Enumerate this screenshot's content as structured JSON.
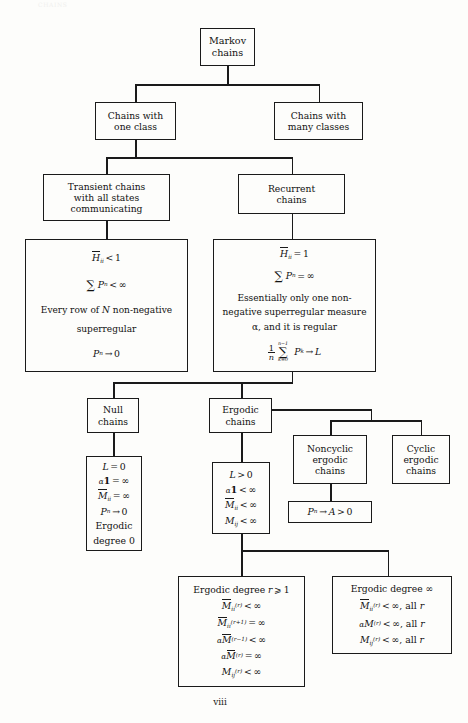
{
  "page": {
    "number": "viii",
    "header_faint": "CHAINS"
  },
  "diagram": {
    "nodes": {
      "root": {
        "lines": [
          "Markov",
          "chains"
        ]
      },
      "one_class": {
        "lines": [
          "Chains with",
          "one class"
        ]
      },
      "many_classes": {
        "lines": [
          "Chains with",
          "many classes"
        ]
      },
      "transient": {
        "lines": [
          "Transient chains",
          "with all states",
          "communicating"
        ]
      },
      "recurrent": {
        "lines": [
          "Recurrent",
          "chains"
        ]
      },
      "transient_props": {
        "lines": [
          "H̄ii < 1",
          "∑ Pⁿ < ∞",
          "Every row of N non-negative",
          "superregular",
          "Pⁿ → 0"
        ]
      },
      "recurrent_props": {
        "lines": [
          "H̄ii = 1",
          "∑ Pⁿ = ∞",
          "Essentially only one non-",
          "negative superregular measure",
          "α, and it is regular",
          "(1/n) ∑ₖ₌₀ⁿ⁻¹ Pᵏ → L"
        ]
      },
      "null_chains": {
        "lines": [
          "Null",
          "chains"
        ]
      },
      "ergodic_chains": {
        "lines": [
          "Ergodic",
          "chains"
        ]
      },
      "noncyclic": {
        "lines": [
          "Noncyclic",
          "ergodic",
          "chains"
        ]
      },
      "cyclic": {
        "lines": [
          "Cyclic",
          "ergodic",
          "chains"
        ]
      },
      "null_props": {
        "lines": [
          "L = 0",
          "α1 = ∞",
          "M̄ii = ∞",
          "Pⁿ → 0",
          "Ergodic",
          "degree 0"
        ]
      },
      "ergodic_props": {
        "lines": [
          "L > 0",
          "α1 < ∞",
          "M̄ii < ∞",
          "Mij < ∞"
        ]
      },
      "noncyclic_props": {
        "lines": [
          "Pⁿ → A > 0"
        ]
      },
      "degree_r": {
        "lines": [
          "Ergodic degree r ⩾ 1",
          "M̄ii⁽ʳ⁾ < ∞",
          "M̄ii⁽ʳ⁺¹⁾ = ∞",
          "αM̄⁽ʳ⁻¹⁾ < ∞",
          "αM̄⁽ʳ⁾ = ∞",
          "Mij⁽ʳ⁾ < ∞"
        ]
      },
      "degree_inf": {
        "lines": [
          "Ergodic degree ∞",
          "M̄ii⁽ʳ⁾ < ∞, all r",
          "αM⁽ʳ⁾ < ∞, all r",
          "Mij⁽ʳ⁾ < ∞, all r"
        ]
      }
    }
  },
  "colors": {
    "ink": "#1a1a1a",
    "paper": "#fdfdfb"
  }
}
